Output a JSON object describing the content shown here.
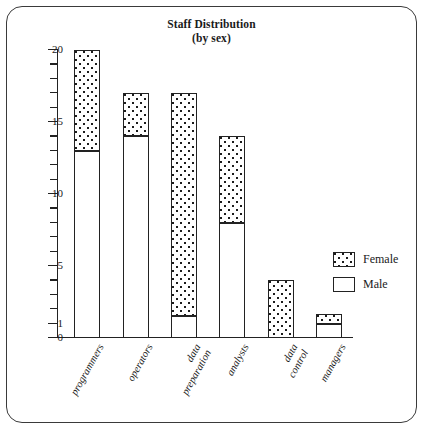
{
  "chart_data": {
    "type": "bar",
    "subtype": "stacked-bar",
    "title": "Staff Distribution",
    "subtitle": "(by sex)",
    "xlabel": "",
    "ylabel": "",
    "ylim": [
      0,
      20
    ],
    "grid": false,
    "legend_position": "right",
    "y_major_ticks": [
      0,
      1,
      5,
      10,
      15,
      20
    ],
    "y_tick_labels": [
      "0",
      "1",
      "5",
      "10",
      "15",
      "20"
    ],
    "y_minor_tick_interval": 1,
    "categories": [
      "programmers",
      "operators",
      "data\npreparation",
      "analysts",
      "data\ncontrol",
      "managers"
    ],
    "series": [
      {
        "name": "Male",
        "fill": "white",
        "values": [
          13,
          14,
          1.5,
          8,
          0,
          1
        ]
      },
      {
        "name": "Female",
        "fill": "dotted",
        "values": [
          7,
          3,
          15.5,
          6,
          4,
          0.7
        ]
      }
    ],
    "totals": [
      20,
      17,
      17,
      14,
      4,
      1.7
    ]
  },
  "legend": {
    "entries": [
      {
        "label": "Female",
        "swatch": "dotted-swatch"
      },
      {
        "label": "Male",
        "swatch": "white-swatch"
      }
    ]
  },
  "colors": {
    "ink": "#222222",
    "background": "#ffffff",
    "frame": "#3a3a3a"
  }
}
